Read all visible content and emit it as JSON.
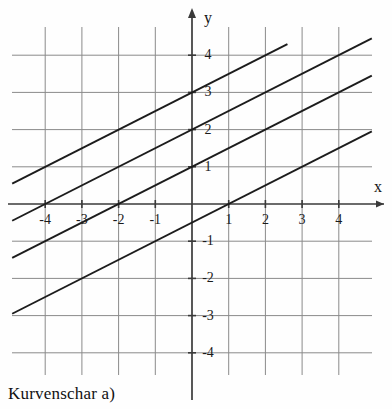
{
  "caption": "Kurvenschar a)",
  "axes": {
    "x_name": "x",
    "y_name": "y",
    "x_ticks": [
      "-4",
      "-3",
      "-2",
      "-1",
      "1",
      "2",
      "3",
      "4"
    ],
    "y_ticks": [
      "4",
      "3",
      "2",
      "1",
      "-1",
      "-2",
      "-3",
      "-4"
    ]
  },
  "colors": {
    "grid": "#8a8a8a",
    "axis": "#3a3a3a",
    "curve": "#1c1c1c",
    "text": "#151515",
    "background": "#fefefe"
  },
  "chart_data": {
    "type": "line",
    "title": "Kurvenschar a)",
    "xlabel": "x",
    "ylabel": "y",
    "xlim": [
      -4.9,
      4.9
    ],
    "ylim": [
      -4.6,
      4.6
    ],
    "xticks": [
      -4,
      -3,
      -2,
      -1,
      1,
      2,
      3,
      4
    ],
    "yticks": [
      4,
      3,
      2,
      1,
      -1,
      -2,
      -3,
      -4
    ],
    "grid": true,
    "legend": "none",
    "series": [
      {
        "name": "y = 0.5x + 3",
        "slope": 0.5,
        "intercept": 3,
        "values": [
          {
            "x": -4.9,
            "y": 0.55
          },
          {
            "x": 2.6,
            "y": 4.3
          }
        ]
      },
      {
        "name": "y = 0.5x + 2",
        "slope": 0.5,
        "intercept": 2,
        "values": [
          {
            "x": -4.9,
            "y": -0.45
          },
          {
            "x": 4.9,
            "y": 4.45
          }
        ]
      },
      {
        "name": "y = 0.5x + 1",
        "slope": 0.5,
        "intercept": 1,
        "values": [
          {
            "x": -4.9,
            "y": -1.45
          },
          {
            "x": 4.9,
            "y": 3.45
          }
        ]
      },
      {
        "name": "y = 0.5x - 0.5",
        "slope": 0.5,
        "intercept": -0.5,
        "values": [
          {
            "x": -4.9,
            "y": -2.95
          },
          {
            "x": 4.9,
            "y": 1.95
          }
        ]
      }
    ]
  }
}
